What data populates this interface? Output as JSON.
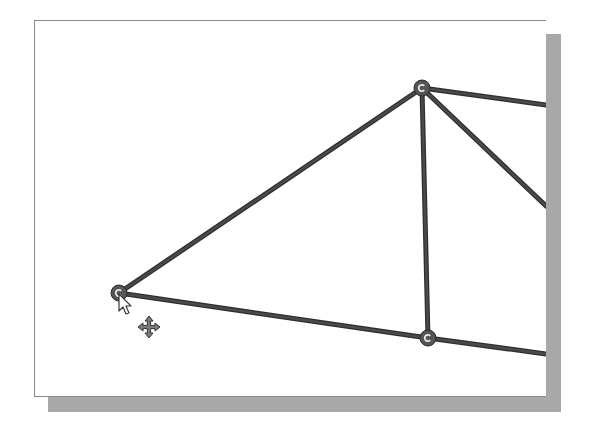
{
  "viewport": {
    "background": "#ffffff",
    "frame_border_color": "#8a8a8a",
    "shadow_color": "#a8a8a8"
  },
  "truss": {
    "member_color": "#4a4a4a",
    "member_outline_color": "#2e2e2e",
    "joint_fill": "#555555",
    "joint_center": "#e6e6e6",
    "joints": [
      {
        "id": "left-support-joint",
        "x": 119,
        "y": 293
      },
      {
        "id": "top-joint",
        "x": 422,
        "y": 88
      },
      {
        "id": "bottom-joint",
        "x": 428,
        "y": 338
      }
    ],
    "members": [
      {
        "id": "left-top-chord",
        "x1": 119,
        "y1": 293,
        "x2": 422,
        "y2": 88
      },
      {
        "id": "left-bottom-chord",
        "x1": 119,
        "y1": 293,
        "x2": 428,
        "y2": 338
      },
      {
        "id": "vertical-member",
        "x1": 422,
        "y1": 88,
        "x2": 428,
        "y2": 338
      },
      {
        "id": "right-top-chord",
        "x1": 422,
        "y1": 88,
        "x2": 546,
        "y2": 105
      },
      {
        "id": "right-diagonal",
        "x1": 422,
        "y1": 88,
        "x2": 546,
        "y2": 206
      },
      {
        "id": "right-bottom-chord",
        "x1": 428,
        "y1": 338,
        "x2": 546,
        "y2": 354
      }
    ]
  },
  "cursor": {
    "type": "arrow-with-move",
    "x": 119,
    "y": 294,
    "move_icon_x": 149,
    "move_icon_y": 327
  }
}
